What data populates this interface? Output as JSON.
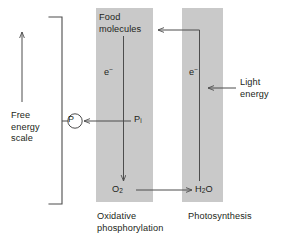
{
  "diagram": {
    "colors": {
      "band_fill": "#c9c9c9",
      "line": "#4d4d4d",
      "text": "#231f20",
      "background": "#ffffff"
    },
    "columns": [
      {
        "id": "oxidative-phosphorylation",
        "caption": "Oxidative\nphosphorylation",
        "top_species": "Food\nmolecules",
        "bottom_species": "O2",
        "bottom_species_text": "O",
        "bottom_species_sub": "2",
        "carrier": "e",
        "carrier_charge": "−",
        "flow_direction": "downward"
      },
      {
        "id": "photosynthesis",
        "caption": "Photosynthesis",
        "top_species": "Food molecules",
        "bottom_species": "H2O",
        "bottom_species_text_1": "H",
        "bottom_species_sub": "2",
        "bottom_species_text_2": "O",
        "carrier": "e",
        "carrier_charge": "−",
        "flow_direction": "upward"
      }
    ],
    "labels": {
      "food_molecules": "Food\nmolecules",
      "electron_left": "e",
      "electron_left_charge": "−",
      "electron_right": "e",
      "electron_right_charge": "−",
      "inorganic_phosphate": "P",
      "inorganic_phosphate_sub": "i",
      "oxygen": "O",
      "oxygen_sub": "2",
      "water_h": "H",
      "water_sub": "2",
      "water_o": "O",
      "light_energy": "Light\nenergy",
      "free_energy_scale": "Free\nenergy\nscale",
      "oxidative_phosphorylation": "Oxidative\nphosphorylation",
      "photosynthesis": "Photosynthesis",
      "high_energy_phosphate": "P"
    },
    "arrows": [
      {
        "name": "free-energy-scale-arrow",
        "direction": "up",
        "meaning": "increasing free energy"
      },
      {
        "name": "oxidative-electron-flow-arrow",
        "direction": "down",
        "meaning": "electrons flow from food molecules to O2"
      },
      {
        "name": "photosynthesis-electron-flow-arrow",
        "direction": "up",
        "meaning": "electrons flow from H2O to food molecules"
      },
      {
        "name": "phosphate-transfer-arrow",
        "direction": "left",
        "meaning": "Pi converted to high-energy phosphate"
      },
      {
        "name": "light-energy-arrow",
        "direction": "left",
        "meaning": "light energy input to photosynthesis"
      },
      {
        "name": "oxygen-to-water-arrow",
        "direction": "right",
        "meaning": "O2 reduced to H2O"
      },
      {
        "name": "food-molecules-input-arrow",
        "direction": "left",
        "meaning": "photosynthesis produces food molecules"
      }
    ]
  }
}
